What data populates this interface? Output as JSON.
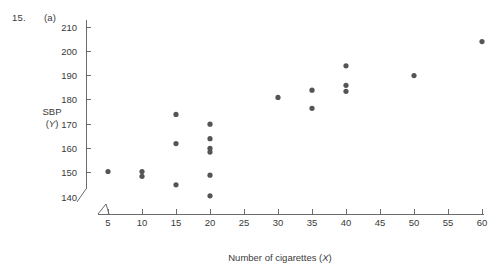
{
  "figure": {
    "problem_number": "15.",
    "part_letter": "(a)",
    "y_axis_label_line1": "SBP",
    "y_axis_label_line2_prefix": "(",
    "y_axis_label_line2_var": "Y",
    "y_axis_label_line2_suffix": ")",
    "x_axis_label_text": "Number of cigarettes (",
    "x_axis_label_var": "X",
    "x_axis_label_suffix": ")",
    "point_color": "#555555",
    "axis_color": "#6b6b6b"
  },
  "chart_data": {
    "type": "scatter",
    "title": "",
    "xlabel": "Number of cigarettes (X)",
    "ylabel": "SBP (Y)",
    "xlim": [
      5,
      60
    ],
    "ylim": [
      140,
      212
    ],
    "xticks": [
      5,
      10,
      15,
      20,
      25,
      30,
      35,
      40,
      45,
      50,
      55,
      60
    ],
    "yticks": [
      140,
      150,
      160,
      170,
      180,
      190,
      200,
      210
    ],
    "xtick_labels": [
      "5",
      "10",
      "15",
      "20",
      "25",
      "30",
      "35",
      "40",
      "45",
      "50",
      "55",
      "60"
    ],
    "ytick_labels": [
      "140",
      "150",
      "160",
      "170",
      "180",
      "190",
      "200",
      "210"
    ],
    "grid": false,
    "legend": false,
    "axis_break_x": true,
    "axis_break_y": true,
    "series": [
      {
        "name": "SBP vs cigarettes",
        "x": [
          5,
          10,
          10,
          15,
          15,
          15,
          20,
          20,
          20,
          20,
          20,
          20,
          30,
          35,
          35,
          40,
          40,
          40,
          50,
          60
        ],
        "y": [
          150.5,
          150.5,
          148.5,
          174.0,
          162.0,
          145.0,
          170.0,
          164.0,
          160.0,
          158.5,
          149.0,
          140.5,
          181.0,
          184.0,
          176.5,
          194.0,
          186.0,
          183.5,
          190.0,
          204.0
        ]
      }
    ]
  }
}
